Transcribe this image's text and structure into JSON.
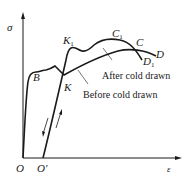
{
  "diagram": {
    "axes": {
      "y_label": "σ",
      "x_label": "ε",
      "origin_label": "O",
      "origin_prime_label": "O'"
    },
    "points": {
      "B": "B",
      "K": "K",
      "K1_main": "K",
      "K1_sub": "1",
      "C": "C",
      "C1_main": "C",
      "C1_sub": "1",
      "D": "D",
      "D1_main": "D",
      "D1_sub": "1"
    },
    "annotations": {
      "after": "After cold drawn",
      "before": "Before cold drawn"
    },
    "colors": {
      "line": "#1a1a1a",
      "background": "#ffffff"
    }
  }
}
